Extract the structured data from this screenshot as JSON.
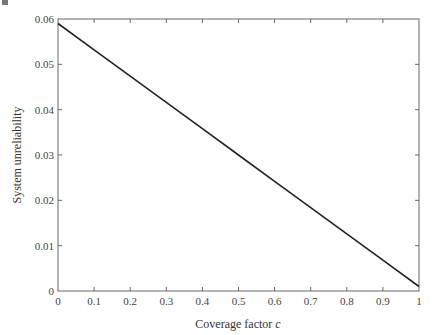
{
  "chart_data": {
    "type": "line",
    "title": "",
    "xlabel": "Coverage factor c",
    "xlabel_main": "Coverage factor ",
    "xlabel_var": "c",
    "ylabel": "System unreliability",
    "xlim": [
      0,
      1
    ],
    "ylim": [
      0,
      0.06
    ],
    "grid": false,
    "legend": null,
    "x_ticks": [
      "0",
      "0.1",
      "0.2",
      "0.3",
      "0.4",
      "0.5",
      "0.6",
      "0.7",
      "0.8",
      "0.9",
      "1"
    ],
    "y_ticks": [
      "0",
      "0.01",
      "0.02",
      "0.03",
      "0.04",
      "0.05",
      "0.06"
    ],
    "series": [
      {
        "name": "System unreliability",
        "color": "#222222",
        "x": [
          0,
          0.1,
          0.2,
          0.3,
          0.4,
          0.5,
          0.6,
          0.7,
          0.8,
          0.9,
          1.0
        ],
        "y": [
          0.059,
          0.0532,
          0.0474,
          0.0416,
          0.0358,
          0.03,
          0.0242,
          0.0184,
          0.0126,
          0.0068,
          0.001
        ]
      }
    ]
  }
}
